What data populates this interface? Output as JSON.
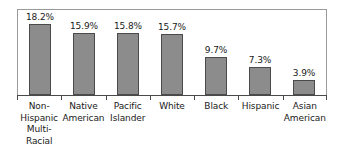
{
  "chart_data": {
    "type": "bar",
    "title": "",
    "subtitle": "",
    "xlabel": "",
    "ylabel": "",
    "ylim": [
      0,
      20
    ],
    "grid": false,
    "legend": "none",
    "orientation": "vertical",
    "bar_color": "#8c8c8c",
    "bar_border_color": "#4a4a4a",
    "frame_color": "#9a9a9a",
    "axis_color": "#4a4a4a",
    "categories": [
      "Non-Hispanic Multi-Racial",
      "Native American",
      "Pacific Islander",
      "White",
      "Black",
      "Hispanic",
      "Asian American"
    ],
    "category_lines": [
      [
        "Non-",
        "Hispanic",
        "Multi-",
        "Racial"
      ],
      [
        "Native",
        "American"
      ],
      [
        "Pacific",
        "Islander"
      ],
      [
        "White"
      ],
      [
        "Black"
      ],
      [
        "Hispanic"
      ],
      [
        "Asian",
        "American"
      ]
    ],
    "values": [
      18.2,
      15.9,
      15.8,
      15.7,
      9.7,
      7.3,
      3.9
    ],
    "value_labels": [
      "18.2%",
      "15.9%",
      "15.8%",
      "15.7%",
      "9.7%",
      "7.3%",
      "3.9%"
    ]
  }
}
